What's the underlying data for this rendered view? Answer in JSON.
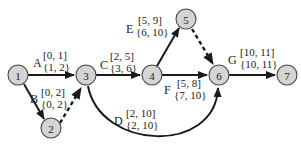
{
  "diagram": {
    "type": "activity-on-arrow network (CPM)",
    "nodes": [
      {
        "id": "1",
        "label": "1",
        "x": 18,
        "y": 75
      },
      {
        "id": "2",
        "label": "2",
        "x": 51,
        "y": 128
      },
      {
        "id": "3",
        "label": "3",
        "x": 86,
        "y": 75
      },
      {
        "id": "4",
        "label": "4",
        "x": 152,
        "y": 75
      },
      {
        "id": "5",
        "label": "5",
        "x": 186,
        "y": 19
      },
      {
        "id": "6",
        "label": "6",
        "x": 219,
        "y": 75
      },
      {
        "id": "7",
        "label": "7",
        "x": 287,
        "y": 75
      }
    ],
    "activities": [
      {
        "name": "A",
        "from": "1",
        "to": "3",
        "es_ef": "[0, 1]",
        "ls_lf": "{1, 2}"
      },
      {
        "name": "B",
        "from": "1",
        "to": "2",
        "es_ef": "[0, 2]",
        "ls_lf": "{0, 2}"
      },
      {
        "name": "C",
        "from": "3",
        "to": "4",
        "es_ef": "[2, 5]",
        "ls_lf": "{3, 6}"
      },
      {
        "name": "D",
        "from": "3",
        "to": "6",
        "es_ef": "[2, 10]",
        "ls_lf": "{2, 10}"
      },
      {
        "name": "E",
        "from": "4",
        "to": "5",
        "es_ef": "[5, 9]",
        "ls_lf": "{6, 10}"
      },
      {
        "name": "F",
        "from": "4",
        "to": "6",
        "es_ef": "[5, 8]",
        "ls_lf": "{7, 10}"
      },
      {
        "name": "G",
        "from": "6",
        "to": "7",
        "es_ef": "[10, 11]",
        "ls_lf": "{10, 11}"
      }
    ],
    "dummies": [
      {
        "from": "2",
        "to": "3"
      },
      {
        "from": "5",
        "to": "6"
      }
    ]
  }
}
